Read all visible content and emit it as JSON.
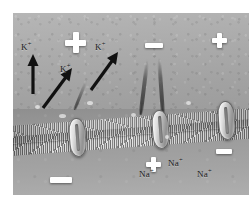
{
  "figure": {
    "background_color": "#9c9c9c",
    "membrane_color": "#b5b5b5",
    "symbol_color": "#ffffff",
    "label_color": "#1a1a1a"
  },
  "regions": {
    "extracellular": {
      "name": "Extracellular fluid (outside)",
      "net_charge": "+"
    },
    "membrane": {
      "name": "Phospholipid bilayer membrane"
    },
    "intracellular": {
      "name": "Cytoplasm (inside)",
      "net_charge": "-"
    }
  },
  "ions": [
    {
      "id": "k-1",
      "element": "K",
      "charge": "+",
      "label": "K",
      "superscript": "+",
      "region": "extracellular"
    },
    {
      "id": "k-2",
      "element": "K",
      "charge": "+",
      "label": "K",
      "superscript": "+",
      "region": "extracellular"
    },
    {
      "id": "k-3",
      "element": "K",
      "charge": "+",
      "label": "K",
      "superscript": "+",
      "region": "extracellular"
    },
    {
      "id": "na-1",
      "element": "Na",
      "charge": "+",
      "label": "Na",
      "superscript": "+",
      "region": "intracellular"
    },
    {
      "id": "na-2",
      "element": "Na",
      "charge": "+",
      "label": "Na",
      "superscript": "+",
      "region": "intracellular"
    },
    {
      "id": "na-3",
      "element": "Na",
      "charge": "+",
      "label": "Na",
      "superscript": "+",
      "region": "intracellular"
    }
  ],
  "charge_symbols": [
    {
      "id": "plus-top-left",
      "symbol": "+",
      "region": "extracellular"
    },
    {
      "id": "plus-top-right",
      "symbol": "+",
      "region": "extracellular"
    },
    {
      "id": "minus-top-mid",
      "symbol": "-",
      "region": "extracellular"
    },
    {
      "id": "plus-bottom",
      "symbol": "+",
      "region": "intracellular"
    },
    {
      "id": "minus-bottom-left",
      "symbol": "-",
      "region": "intracellular"
    },
    {
      "id": "minus-bottom-right",
      "symbol": "-",
      "region": "intracellular"
    }
  ],
  "arrows": [
    {
      "id": "arrow-1",
      "direction": "up",
      "meaning": "K+ efflux"
    },
    {
      "id": "arrow-2",
      "direction": "up-right",
      "meaning": "K+ efflux"
    },
    {
      "id": "arrow-3",
      "direction": "up-right",
      "meaning": "K+ efflux through channel"
    }
  ],
  "channels": [
    {
      "id": "channel-1",
      "name": "membrane protein channel"
    },
    {
      "id": "channel-2",
      "name": "membrane protein channel"
    },
    {
      "id": "channel-3",
      "name": "membrane protein channel"
    }
  ]
}
